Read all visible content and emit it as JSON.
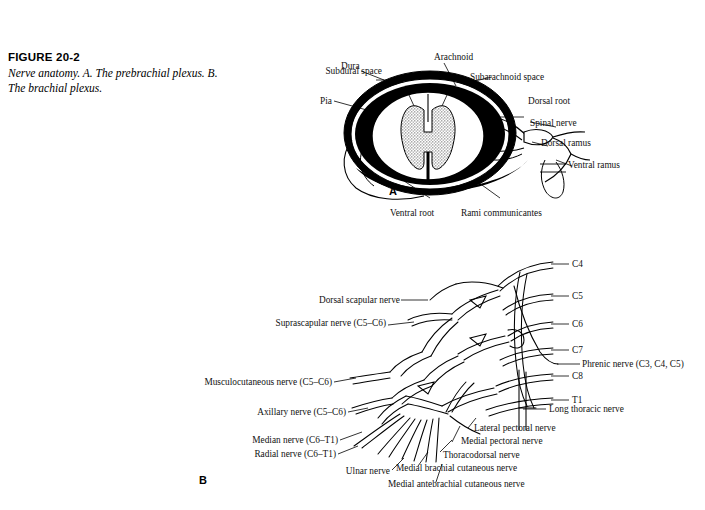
{
  "figure": {
    "number": "FIGURE 20-2",
    "caption": "Nerve anatomy. A. The prebrachial plexus. B. The brachial plexus."
  },
  "colors": {
    "page_background": "#ffffff",
    "ink": "#000000",
    "gray_matter_stipple": "#7a7a7a"
  },
  "panel_a": {
    "letter": "A",
    "title": "Spinal cord cross-section with meninges and nerve roots",
    "labels": [
      {
        "id": "dura",
        "text": "Dura",
        "side": "top"
      },
      {
        "id": "arachnoid",
        "text": "Arachnoid",
        "side": "top"
      },
      {
        "id": "subdural-space",
        "text": "Subdural space",
        "side": "left"
      },
      {
        "id": "subarachnoid-space",
        "text": "Subarachnoid space",
        "side": "right"
      },
      {
        "id": "pia",
        "text": "Pia",
        "side": "left"
      },
      {
        "id": "dorsal-root",
        "text": "Dorsal root",
        "side": "right"
      },
      {
        "id": "spinal-nerve",
        "text": "Spinal nerve",
        "side": "right"
      },
      {
        "id": "dorsal-ramus",
        "text": "Dorsal ramus",
        "side": "right"
      },
      {
        "id": "ventral-ramus",
        "text": "Ventral ramus",
        "side": "right"
      },
      {
        "id": "ventral-root",
        "text": "Ventral root",
        "side": "bottom"
      },
      {
        "id": "rami-communicantes",
        "text": "Rami communicantes",
        "side": "bottom"
      }
    ]
  },
  "panel_b": {
    "letter": "B",
    "title": "Brachial plexus branches and nerve roots",
    "roots": [
      {
        "id": "c4",
        "text": "C4"
      },
      {
        "id": "c5",
        "text": "C5"
      },
      {
        "id": "c6",
        "text": "C6"
      },
      {
        "id": "c7",
        "text": "C7"
      },
      {
        "id": "c8",
        "text": "C8"
      },
      {
        "id": "t1",
        "text": "T1"
      }
    ],
    "labels_left": [
      {
        "id": "dorsal-scapular-nerve",
        "text": "Dorsal scapular nerve"
      },
      {
        "id": "suprascapular-nerve",
        "text": "Suprascapular nerve (C5–C6)"
      },
      {
        "id": "musculocutaneous-nerve",
        "text": "Musculocutaneous nerve (C5–C6)"
      },
      {
        "id": "axillary-nerve",
        "text": "Axillary nerve (C5–C6)"
      },
      {
        "id": "median-nerve",
        "text": "Median nerve (C6–T1)"
      },
      {
        "id": "radial-nerve",
        "text": "Radial nerve (C6–T1)"
      },
      {
        "id": "ulnar-nerve",
        "text": "Ulnar nerve"
      }
    ],
    "labels_right": [
      {
        "id": "phrenic-nerve",
        "text": "Phrenic nerve (C3, C4, C5)"
      },
      {
        "id": "long-thoracic-nerve",
        "text": "Long thoracic nerve"
      },
      {
        "id": "lateral-pectoral-nerve",
        "text": "Lateral pectoral nerve"
      },
      {
        "id": "medial-pectoral-nerve",
        "text": "Medial pectoral nerve"
      },
      {
        "id": "thoracodorsal-nerve",
        "text": "Thoracodorsal nerve"
      },
      {
        "id": "medial-brachial-cutaneous-nerve",
        "text": "Medial brachial cutaneous nerve"
      },
      {
        "id": "medial-antebrachial-cutaneous-nerve",
        "text": "Medial antebrachial cutaneous nerve"
      }
    ]
  }
}
